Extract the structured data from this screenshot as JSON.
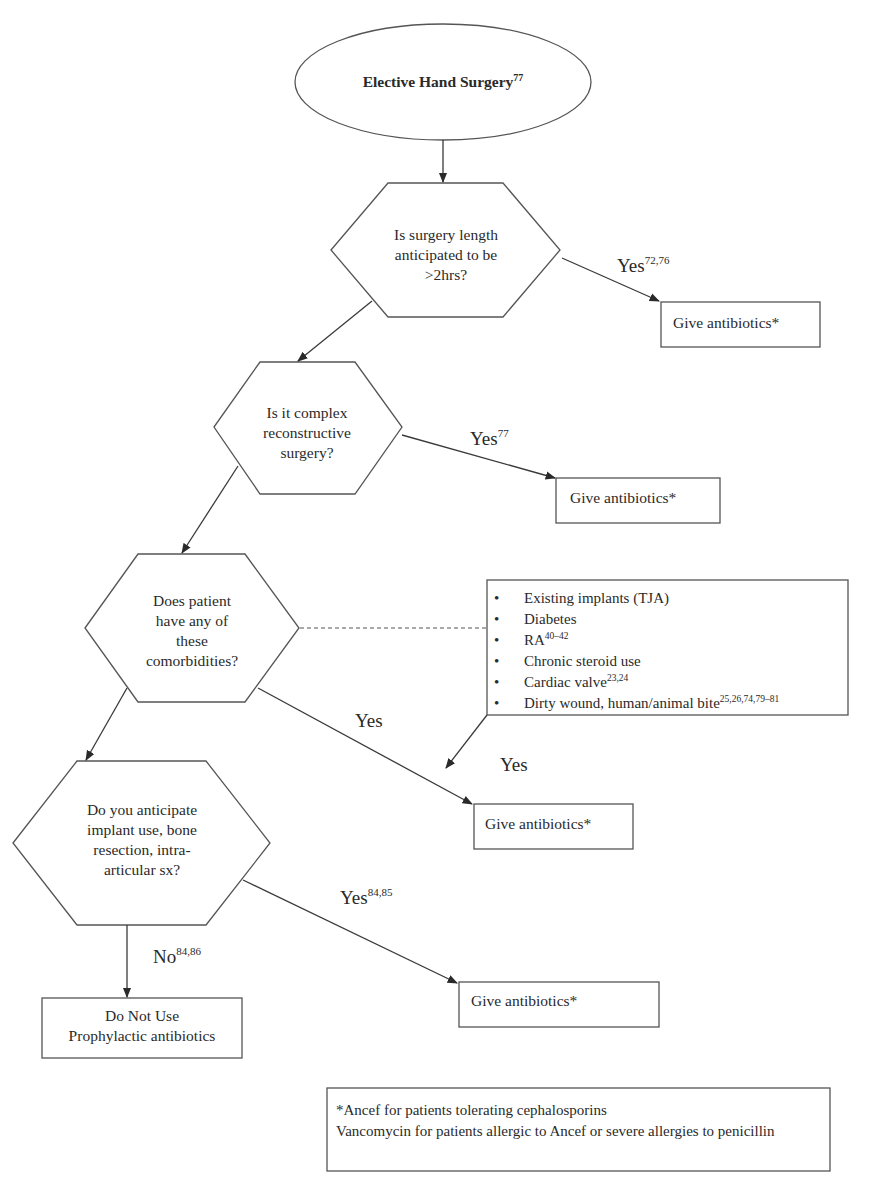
{
  "colors": {
    "background": "#ffffff",
    "stroke": "#555555",
    "text": "#2a2a2a"
  },
  "start": {
    "label": "Elective Hand Surgery",
    "ref": "77"
  },
  "decisions": [
    {
      "id": "q1",
      "lines": [
        "Is surgery length",
        "anticipated to be",
        ">2hrs?"
      ],
      "yes_label": "Yes",
      "yes_ref": "72,76"
    },
    {
      "id": "q2",
      "lines": [
        "Is it complex",
        "reconstructive",
        "surgery?"
      ],
      "yes_label": "Yes",
      "yes_ref": "77"
    },
    {
      "id": "q3",
      "lines": [
        "Does patient",
        "have any of",
        "these",
        "comorbidities?"
      ],
      "yes_label": "Yes",
      "yes_ref": "",
      "list_yes_label": "Yes"
    },
    {
      "id": "q4",
      "lines": [
        "Do you anticipate",
        "implant use, bone",
        "resection, intra-",
        "articular sx?"
      ],
      "yes_label": "Yes",
      "yes_ref": "84,85",
      "no_label": "No",
      "no_ref": "84,86"
    }
  ],
  "outcomes": {
    "give_antibiotics": "Give antibiotics*",
    "do_not_use_line1": "Do Not Use",
    "do_not_use_line2": "Prophylactic antibiotics"
  },
  "comorbidities": {
    "bullet": "•",
    "items": [
      {
        "text": "Existing implants (TJA)",
        "ref": ""
      },
      {
        "text": "Diabetes",
        "ref": ""
      },
      {
        "text": "RA",
        "ref": "40–42"
      },
      {
        "text": "Chronic steroid use",
        "ref": ""
      },
      {
        "text": "Cardiac valve",
        "ref": "23,24"
      },
      {
        "text": "Dirty wound, human/animal bite",
        "ref": "25,26,74,79–81"
      }
    ]
  },
  "footnote": {
    "line1": "*Ancef for patients tolerating cephalosporins",
    "line2": "Vancomycin for patients allergic to Ancef or severe allergies to penicillin"
  }
}
